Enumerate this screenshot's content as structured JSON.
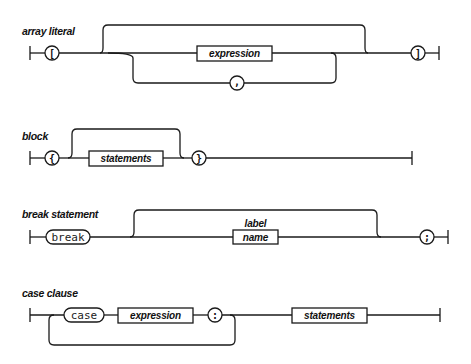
{
  "diagrams": [
    {
      "title": "array literal",
      "nodes": {
        "open": "[",
        "expression": "expression",
        "separator": ",",
        "close": "]"
      }
    },
    {
      "title": "block",
      "nodes": {
        "open": "{",
        "statements": "statements",
        "close": "}"
      }
    },
    {
      "title": "break statement",
      "nodes": {
        "keyword": "break",
        "label_caption": "label",
        "name": "name",
        "terminator": ";"
      }
    },
    {
      "title": "case clause",
      "nodes": {
        "keyword": "case",
        "expression": "expression",
        "colon": ":",
        "statements": "statements"
      }
    }
  ],
  "colors": {
    "stroke": "#1a1a1a",
    "background": "#ffffff",
    "text": "#111111"
  }
}
